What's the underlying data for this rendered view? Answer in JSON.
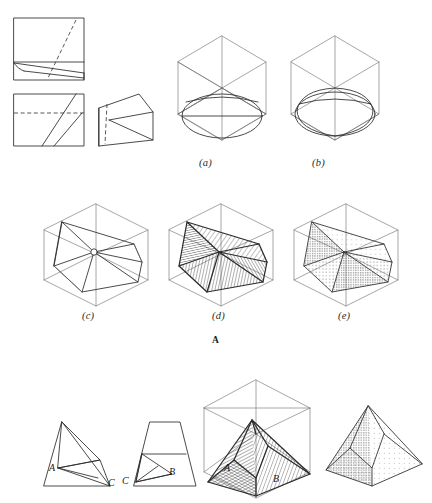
{
  "page": {
    "background_color": "#ffffff",
    "ink_color": "#2b2b2b",
    "light_ink_color": "#6e6e6e",
    "width": 432,
    "height": 503
  },
  "sections": [
    {
      "id": "A",
      "label": "A",
      "caption_labels": [
        "(a)",
        "(b)",
        "(c)",
        "(d)",
        "(e)"
      ]
    },
    {
      "id": "B",
      "label": "",
      "caption_labels": []
    }
  ],
  "captions": {
    "a": "(a)",
    "b": "(b)",
    "c": "(c)",
    "d": "(d)",
    "e": "(e)",
    "section_a": "A"
  },
  "ortho_top": {
    "name": "top-view-square",
    "description": "square with dashed diagonal and near-bottom horizontal edge"
  },
  "ortho_front": {
    "name": "front-view-rectangle",
    "description": "rectangle with dashed horizontal line and two parallel diagonals"
  },
  "ortho_side": {
    "name": "side-view-wedge",
    "description": "wedge trapezoid with dashed vertical and diagonal face line"
  },
  "figure_a": {
    "name": "isometric-cube-with-ellipse",
    "description": "isometric cube outline with inscribed ellipse on lower face"
  },
  "figure_b": {
    "name": "isometric-cube-with-blocked-ellipse",
    "description": "isometric cube with rounded blocked-in ellipse form"
  },
  "figure_c": {
    "name": "faceted-solid-outline",
    "description": "triangulated faceted solid inscribed in isometric cube"
  },
  "figure_d": {
    "name": "faceted-solid-line-shaded",
    "description": "faceted solid rendered with parallel line hatching"
  },
  "figure_e": {
    "name": "faceted-solid-stippled",
    "description": "faceted solid rendered with stipple dot shading"
  },
  "ortho_tri": {
    "name": "triangle-view",
    "labels": {
      "a": "A",
      "c": "C"
    }
  },
  "ortho_trap": {
    "name": "trapezoid-view",
    "labels": {
      "c": "C",
      "b": "B"
    }
  },
  "figure_pyramid_shaded": {
    "name": "pyramid-line-shaded",
    "labels": {
      "a": "A",
      "b": "B"
    }
  },
  "figure_pyramid_stipple": {
    "name": "pyramid-stippled",
    "labels": {}
  }
}
